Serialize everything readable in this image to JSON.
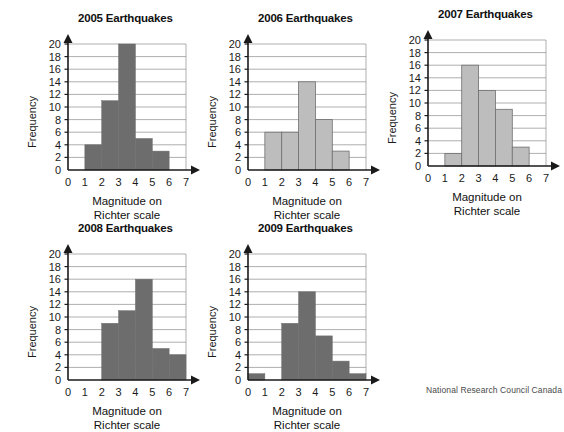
{
  "figure": {
    "credit": "National Research Council Canada",
    "axis_caption_line1": "Magnitude on",
    "axis_caption_line2": "Richter scale",
    "ylabel": "Frequency",
    "colors": {
      "bar_dark": "#6d6d6d",
      "bar_light": "#bdbdbd",
      "axis": "#1a1a1a",
      "grid": "#8c8c8c"
    }
  },
  "chart_data": [
    {
      "type": "bar",
      "title": "2005 Earthquakes",
      "xlabel": "Magnitude on Richter scale",
      "ylabel": "Frequency",
      "xlim": [
        0,
        7
      ],
      "ylim": [
        0,
        20
      ],
      "ytick_labels": [
        "0",
        "2",
        "4",
        "6",
        "8",
        "10",
        "12",
        "14",
        "16",
        "18",
        "20"
      ],
      "xtick_labels": [
        "0",
        "1",
        "2",
        "3",
        "4",
        "5",
        "6",
        "7"
      ],
      "grid": true,
      "bar_style": "dark",
      "bins": [
        {
          "from": 1,
          "to": 2,
          "value": 4
        },
        {
          "from": 2,
          "to": 3,
          "value": 11
        },
        {
          "from": 3,
          "to": 4,
          "value": 20
        },
        {
          "from": 4,
          "to": 5,
          "value": 5
        },
        {
          "from": 5,
          "to": 6,
          "value": 3
        }
      ]
    },
    {
      "type": "bar",
      "title": "2006 Earthquakes",
      "xlabel": "Magnitude on Richter scale",
      "ylabel": "Frequency",
      "xlim": [
        0,
        7
      ],
      "ylim": [
        0,
        20
      ],
      "ytick_labels": [
        "0",
        "2",
        "4",
        "6",
        "8",
        "10",
        "12",
        "14",
        "16",
        "18",
        "20"
      ],
      "xtick_labels": [
        "0",
        "1",
        "2",
        "3",
        "4",
        "5",
        "6",
        "7"
      ],
      "grid": true,
      "bar_style": "light",
      "bins": [
        {
          "from": 1,
          "to": 2,
          "value": 6
        },
        {
          "from": 2,
          "to": 3,
          "value": 6
        },
        {
          "from": 3,
          "to": 4,
          "value": 14
        },
        {
          "from": 4,
          "to": 5,
          "value": 8
        },
        {
          "from": 5,
          "to": 6,
          "value": 3
        }
      ]
    },
    {
      "type": "bar",
      "title": "2007 Earthquakes",
      "xlabel": "Magnitude on Richter scale",
      "ylabel": "Frequency",
      "xlim": [
        0,
        7
      ],
      "ylim": [
        0,
        20
      ],
      "ytick_labels": [
        "0",
        "2",
        "4",
        "6",
        "8",
        "10",
        "12",
        "14",
        "16",
        "18",
        "20"
      ],
      "xtick_labels": [
        "0",
        "1",
        "2",
        "3",
        "4",
        "5",
        "6",
        "7"
      ],
      "grid": true,
      "bar_style": "light",
      "bins": [
        {
          "from": 1,
          "to": 2,
          "value": 2
        },
        {
          "from": 2,
          "to": 3,
          "value": 16
        },
        {
          "from": 3,
          "to": 4,
          "value": 12
        },
        {
          "from": 4,
          "to": 5,
          "value": 9
        },
        {
          "from": 5,
          "to": 6,
          "value": 3
        }
      ]
    },
    {
      "type": "bar",
      "title": "2008 Earthquakes",
      "xlabel": "Magnitude on Richter scale",
      "ylabel": "Frequency",
      "xlim": [
        0,
        7
      ],
      "ylim": [
        0,
        20
      ],
      "ytick_labels": [
        "0",
        "2",
        "4",
        "6",
        "8",
        "10",
        "12",
        "14",
        "16",
        "18",
        "20"
      ],
      "xtick_labels": [
        "0",
        "1",
        "2",
        "3",
        "4",
        "5",
        "6",
        "7"
      ],
      "grid": true,
      "bar_style": "dark",
      "bins": [
        {
          "from": 2,
          "to": 3,
          "value": 9
        },
        {
          "from": 3,
          "to": 4,
          "value": 11
        },
        {
          "from": 4,
          "to": 5,
          "value": 16
        },
        {
          "from": 5,
          "to": 6,
          "value": 5
        },
        {
          "from": 6,
          "to": 7,
          "value": 4
        }
      ]
    },
    {
      "type": "bar",
      "title": "2009 Earthquakes",
      "xlabel": "Magnitude on Richter scale",
      "ylabel": "Frequency",
      "xlim": [
        0,
        7
      ],
      "ylim": [
        0,
        20
      ],
      "ytick_labels": [
        "0",
        "2",
        "4",
        "6",
        "8",
        "10",
        "12",
        "14",
        "16",
        "18",
        "20"
      ],
      "xtick_labels": [
        "0",
        "1",
        "2",
        "3",
        "4",
        "5",
        "6",
        "7"
      ],
      "grid": true,
      "bar_style": "dark",
      "bins": [
        {
          "from": 0,
          "to": 1,
          "value": 1
        },
        {
          "from": 2,
          "to": 3,
          "value": 9
        },
        {
          "from": 3,
          "to": 4,
          "value": 14
        },
        {
          "from": 4,
          "to": 5,
          "value": 7
        },
        {
          "from": 5,
          "to": 6,
          "value": 3
        },
        {
          "from": 6,
          "to": 7,
          "value": 1
        }
      ]
    }
  ]
}
